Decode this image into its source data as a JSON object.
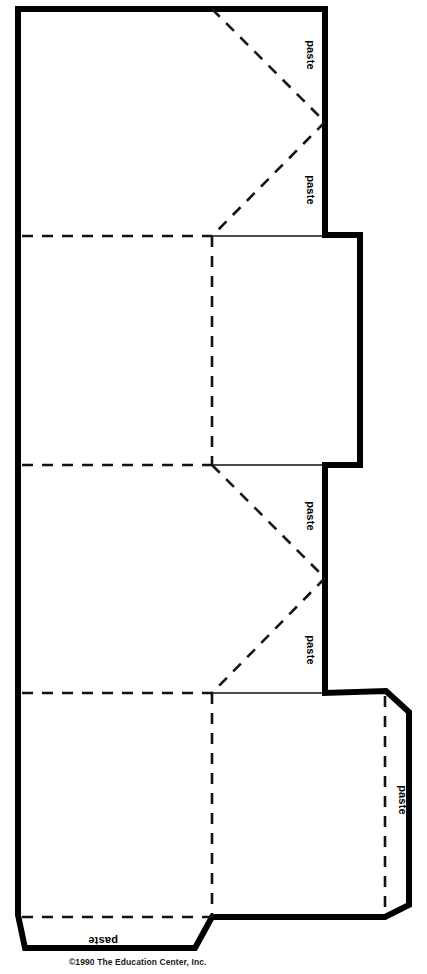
{
  "document": {
    "title": "Paper Model Net Template",
    "type": "printable-craft-template",
    "copyright": "©1990 The Education Center, Inc.",
    "page_width": 427,
    "page_height": 974,
    "background_color": "#ffffff",
    "line_color": "#000000"
  },
  "legend": {
    "solid_thick": "cut line",
    "dashed": "fold line",
    "solid_thin": "panel edge"
  },
  "paste_tabs": [
    {
      "id": "paste-tab-1",
      "label": "paste",
      "x": 307,
      "y": 55,
      "rotation": 90
    },
    {
      "id": "paste-tab-2",
      "label": "paste",
      "x": 307,
      "y": 190,
      "rotation": 90
    },
    {
      "id": "paste-tab-3",
      "label": "paste",
      "x": 307,
      "y": 516,
      "rotation": 90
    },
    {
      "id": "paste-tab-4",
      "label": "paste",
      "x": 307,
      "y": 650,
      "rotation": 90
    },
    {
      "id": "paste-tab-5",
      "label": "paste",
      "x": 399,
      "y": 800,
      "rotation": 90
    },
    {
      "id": "paste-tab-6",
      "label": "paste",
      "x": 103,
      "y": 937,
      "rotation": 180
    }
  ],
  "outline": {
    "name": "cut-outline",
    "path": "M 18 9 L 325 9 L 325 235 L 360 235 L 360 465 L 325 465 L 325 693 L 386 691 L 409 712 L 409 905 L 385 917 L 212 917 L 195 948 L 25 948 L 18 915 Z"
  },
  "thin_edges": [
    {
      "name": "panel-edge-upper",
      "path": "M 212 236 L 325 236"
    },
    {
      "name": "panel-edge-mid-upper",
      "path": "M 212 465 L 325 465"
    },
    {
      "name": "panel-edge-mid-lower",
      "path": "M 212 693 L 325 693"
    },
    {
      "name": "panel-edge-lower-right",
      "path": "M 325 693 L 386 691"
    }
  ],
  "fold_lines": [
    {
      "name": "fold-horizontal-1",
      "path": "M 22 236 L 212 236"
    },
    {
      "name": "fold-horizontal-2",
      "path": "M 22 465 L 212 465"
    },
    {
      "name": "fold-horizontal-3",
      "path": "M 22 693 L 212 693"
    },
    {
      "name": "fold-horizontal-4",
      "path": "M 22 917 L 212 917"
    },
    {
      "name": "fold-vertical-1",
      "path": "M 212 236 L 212 465"
    },
    {
      "name": "fold-vertical-2",
      "path": "M 212 693 L 212 917"
    },
    {
      "name": "fold-vertical-roof-right",
      "path": "M 385 696 L 385 913"
    },
    {
      "name": "fold-diagonal-roof-1",
      "path": "M 212 9 L 325 122"
    },
    {
      "name": "fold-diagonal-roof-2",
      "path": "M 325 122 L 212 236"
    },
    {
      "name": "fold-diagonal-roof-3",
      "path": "M 212 465 L 325 578"
    },
    {
      "name": "fold-diagonal-roof-4",
      "path": "M 325 578 L 212 693"
    }
  ],
  "panels": [
    {
      "name": "panel-top-wall",
      "description": "upper large wall panel"
    },
    {
      "name": "panel-upper-side",
      "description": "upper side panel with step"
    },
    {
      "name": "panel-middle-wall",
      "description": "middle large wall panel"
    },
    {
      "name": "panel-lower-side",
      "description": "lower side panel with step"
    },
    {
      "name": "panel-bottom-wall",
      "description": "bottom large wall panel"
    },
    {
      "name": "panel-roof-flap",
      "description": "right roof flap with paste tab"
    },
    {
      "name": "panel-bottom-flap",
      "description": "bottom paste flap"
    }
  ]
}
